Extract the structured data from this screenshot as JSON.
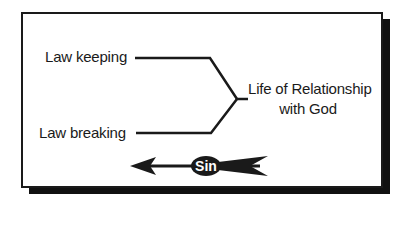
{
  "diagram": {
    "left_items": [
      {
        "label": "Law keeping"
      },
      {
        "label": "Law breaking"
      }
    ],
    "target": {
      "line1": "Life of Relationship",
      "line2": "with God"
    },
    "arrow": {
      "label": "Sin",
      "direction": "left"
    },
    "colors": {
      "ink": "#1a1a1a",
      "background": "#ffffff",
      "shadow": "#111111"
    }
  }
}
